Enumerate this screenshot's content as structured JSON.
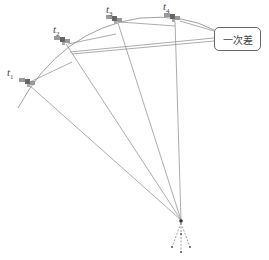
{
  "diagram": {
    "type": "GNSS single-difference illustration",
    "satellites": [
      {
        "id": "t1",
        "label_base": "t",
        "label_sub": "1",
        "x": 28,
        "y": 83
      },
      {
        "id": "t2",
        "label_base": "t",
        "label_sub": "2",
        "x": 63,
        "y": 41
      },
      {
        "id": "t3",
        "label_base": "t",
        "label_sub": "3",
        "x": 115,
        "y": 20
      },
      {
        "id": "t4",
        "label_base": "t",
        "label_sub": "4",
        "x": 173,
        "y": 18
      }
    ],
    "receiver": {
      "x": 181,
      "y": 220
    },
    "callout": {
      "text": "一次差"
    },
    "colors": {
      "line": "#777777",
      "satellite": "#888888",
      "text": "#444444"
    }
  }
}
